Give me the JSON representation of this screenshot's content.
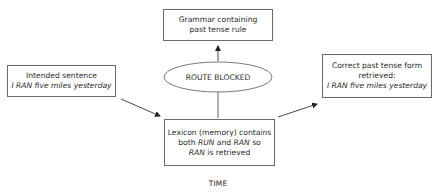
{
  "diagram": {
    "nodes": {
      "grammar": {
        "line1": "Grammar containing",
        "line2": "past tense rule"
      },
      "route_blocked": {
        "label": "ROUTE BLOCKED"
      },
      "intended": {
        "line1": "Intended sentence",
        "line2": "I RAN five miles yesterday"
      },
      "lexicon": {
        "line1": "Lexicon (memory) contains",
        "line2_a": "both ",
        "line2_b": "RUN",
        "line2_c": " and ",
        "line2_d": "RAN",
        "line2_e": " so",
        "line3_a": "RAN",
        "line3_b": " is retrieved"
      },
      "correct": {
        "line1": "Correct past tense form",
        "line2": "retrieved:",
        "line3": "I RAN five miles yesterday"
      }
    },
    "edges": [
      {
        "from": "intended",
        "to": "lexicon",
        "type": "arrow"
      },
      {
        "from": "lexicon",
        "to": "route_blocked",
        "type": "line"
      },
      {
        "from": "route_blocked",
        "to": "grammar",
        "type": "arrow"
      },
      {
        "from": "lexicon",
        "to": "correct",
        "type": "arrow"
      }
    ],
    "axis_label": "TIME",
    "colors": {
      "stroke": "#6a6a6a",
      "arrow": "#222222",
      "text": "#2a2a2a"
    }
  }
}
